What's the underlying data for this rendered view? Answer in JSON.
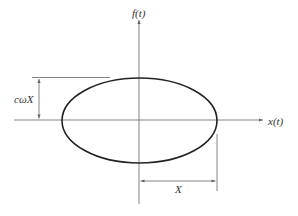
{
  "diagram": {
    "type": "phase-plot",
    "labels": {
      "y_axis": "f(t)",
      "x_axis": "x(t)",
      "vertical_dimension": "cωX",
      "horizontal_dimension": "X"
    },
    "colors": {
      "ellipse": "#222222",
      "axes": "#555555",
      "background": "#ffffff"
    }
  }
}
